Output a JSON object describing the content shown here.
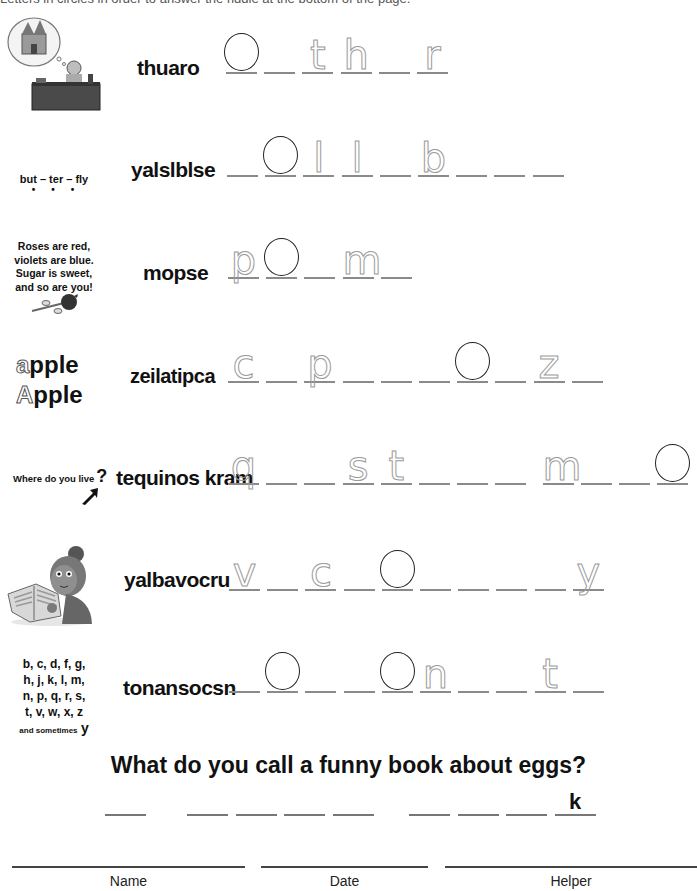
{
  "header": {
    "cut_text": "Letters in circles in order to answer the riddle at the bottom of the page."
  },
  "rows": [
    {
      "scramble": "thuaro",
      "clue_type": "image",
      "clue_icon": "author-dreaming-castle-illustration",
      "answer_length": 6,
      "circled": [
        0
      ],
      "traced": {
        "2": "t",
        "3": "h",
        "5": "r"
      }
    },
    {
      "scramble": "yalslblse",
      "clue_text": "but – ter – fly",
      "clue_dots": 3,
      "answer_length": 9,
      "circled": [
        1
      ],
      "traced": {
        "2": "l",
        "3": "l",
        "5": "b"
      }
    },
    {
      "scramble": "mopse",
      "clue_lines": [
        "Roses are red,",
        "violets are blue.",
        "Sugar is sweet,",
        "and so are you!"
      ],
      "clue_icon": "rose-icon",
      "answer_length": 5,
      "circled": [
        1
      ],
      "traced": {
        "0": "p",
        "3": "m"
      }
    },
    {
      "scramble": "zeilatipca",
      "clue_lines": [
        "apple",
        "Apple"
      ],
      "answer_length": 10,
      "circled": [
        6
      ],
      "traced": {
        "0": "c",
        "2": "p",
        "8": "z"
      }
    },
    {
      "scramble": "tequinos kram",
      "clue_text": "Where do you live",
      "clue_mark": "?",
      "clue_icon": "arrow-pointer-icon",
      "answer_length": 12,
      "circled": [
        11
      ],
      "traced": {
        "0": "q",
        "3": "s",
        "4": "t",
        "8": "m"
      }
    },
    {
      "scramble": "yalbavocru",
      "clue_type": "image",
      "clue_icon": "girl-reading-book-illustration",
      "answer_length": 10,
      "circled": [
        4
      ],
      "traced": {
        "0": "v",
        "2": "c",
        "9": "y"
      }
    },
    {
      "scramble": "tonansocsn",
      "clue_lines": [
        "b, c, d, f, g,",
        "h, j, k, l, m,",
        "n, p, q, r, s,",
        "t, v, w, x, z"
      ],
      "clue_small": "and sometimes",
      "clue_y": "y",
      "answer_length": 10,
      "circled": [
        1,
        4
      ],
      "traced": {
        "5": "n",
        "8": "t"
      }
    }
  ],
  "riddle": {
    "question": "What do you call a funny book about eggs?",
    "words": [
      1,
      4,
      4
    ],
    "given_letter": "k"
  },
  "footer": {
    "name_label": "Name",
    "date_label": "Date",
    "helper_label": "Helper"
  }
}
